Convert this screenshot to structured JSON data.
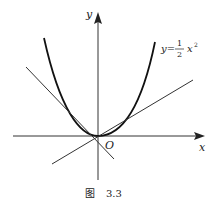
{
  "figure": {
    "caption_prefix": "图",
    "caption_number": "3.3",
    "axes": {
      "x_label": "x",
      "y_label": "y",
      "origin_label": "O"
    },
    "curve": {
      "label_lhs": "y=",
      "label_frac_num": "1",
      "label_frac_den": "2",
      "label_rhs": "x",
      "label_exp": "2",
      "equation": "y = 1/2 x^2"
    },
    "tangent_lines": [
      {
        "name": "left-tangent",
        "slope_sign": "negative"
      },
      {
        "name": "right-tangent",
        "slope_sign": "positive"
      }
    ],
    "colors": {
      "stroke": "#222222",
      "background": "#ffffff"
    }
  }
}
